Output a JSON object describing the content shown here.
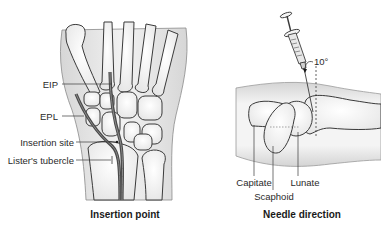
{
  "panels": [
    {
      "id": "left",
      "caption": "Insertion point",
      "labels": [
        {
          "text": "EIP"
        },
        {
          "text": "EPL"
        },
        {
          "text": "Insertion site"
        },
        {
          "text": "Lister's tubercle"
        }
      ]
    },
    {
      "id": "right",
      "caption": "Needle direction",
      "angle_label": "10°",
      "labels": [
        {
          "text": "Capitate"
        },
        {
          "text": "Scaphoid"
        },
        {
          "text": "Lunate"
        }
      ]
    }
  ],
  "colors": {
    "outline": "#3a3a3a",
    "bone_fill": "#f4f4f4",
    "shade": "#d8d8d8",
    "tendon": "#4a4a4a",
    "tendon_inner": "#8a8a8a"
  }
}
